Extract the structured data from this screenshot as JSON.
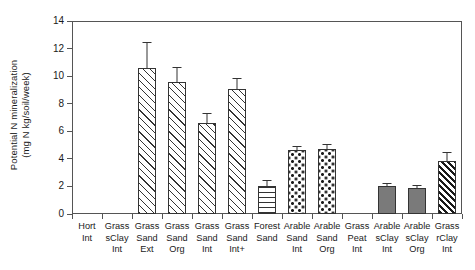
{
  "chart_data": {
    "type": "bar",
    "title": "",
    "xlabel": "",
    "ylabel": "Potential N mineralization (mg N kg/soil/week)",
    "ylabel_line1": "Potential N mineralization",
    "ylabel_line2": "(mg N kg/soil/week)",
    "ylim": [
      0,
      14
    ],
    "yticks": [
      0,
      2,
      4,
      6,
      8,
      10,
      12,
      14
    ],
    "ytick_labels": [
      "0",
      "2",
      "4",
      "6",
      "8",
      "10",
      "12",
      "14"
    ],
    "grid": false,
    "legend": "none",
    "frame": "box",
    "categories": [
      "Hort Int",
      "Grass sClay Int",
      "Grass Sand Ext",
      "Grass Sand Org",
      "Grass Sand Int",
      "Grass Sand Int+",
      "Forest Sand",
      "Arable Sand Int",
      "Arable Sand Org",
      "Grass Peat Int",
      "Arable sClay Int",
      "Arable sClay Org",
      "Grass rClay Int"
    ],
    "category_lines": [
      [
        "Hort",
        "Int"
      ],
      [
        "Grass",
        "sClay",
        "Int"
      ],
      [
        "Grass",
        "Sand",
        "Ext"
      ],
      [
        "Grass",
        "Sand",
        "Org"
      ],
      [
        "Grass",
        "Sand",
        "Int"
      ],
      [
        "Grass",
        "Sand",
        "Int+"
      ],
      [
        "Forest",
        "Sand"
      ],
      [
        "Arable",
        "Sand",
        "Int"
      ],
      [
        "Arable",
        "Sand",
        "Org"
      ],
      [
        "Grass",
        "Peat",
        "Int"
      ],
      [
        "Arable",
        "sClay",
        "Int"
      ],
      [
        "Arable",
        "sClay",
        "Org"
      ],
      [
        "Grass",
        "rClay",
        "Int"
      ]
    ],
    "values": [
      null,
      null,
      10.6,
      9.6,
      6.6,
      9.1,
      2.05,
      4.65,
      4.7,
      null,
      2.0,
      1.9,
      3.85
    ],
    "errors": [
      null,
      null,
      1.9,
      1.05,
      0.75,
      0.8,
      0.45,
      0.3,
      0.35,
      null,
      0.25,
      0.22,
      0.65
    ],
    "patterns": [
      "none",
      "none",
      "diagonal-hatch",
      "diagonal-hatch",
      "diagonal-hatch",
      "diagonal-hatch",
      "horizontal-lines",
      "dotted",
      "dotted",
      "none",
      "solid-gray",
      "solid-gray",
      "dense-diagonal-hatch"
    ],
    "colors": {
      "axis": "#555555",
      "bar_edge": "#333333",
      "gray_fill": "#7a7a7a",
      "hatch": "#1a1a1a",
      "background": "#ffffff"
    }
  }
}
